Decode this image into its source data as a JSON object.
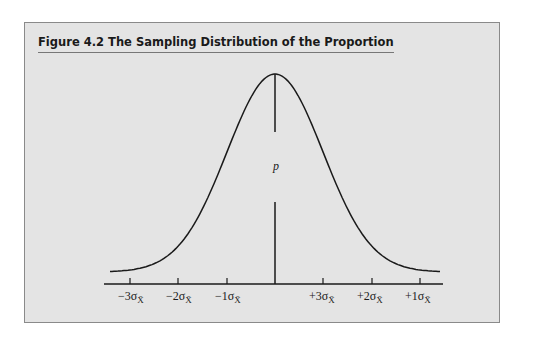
{
  "figure": {
    "title": "Figure 4.2  The Sampling Distribution of the Proportion",
    "center_label": "p",
    "tick_labels": [
      "−3σ",
      "−2σ",
      "−1σ",
      "+3σ",
      "+2σ",
      "+1σ"
    ],
    "tick_subscript": "X̄",
    "colors": {
      "background": "#e4e4e4",
      "line": "#1a1a1a"
    }
  }
}
